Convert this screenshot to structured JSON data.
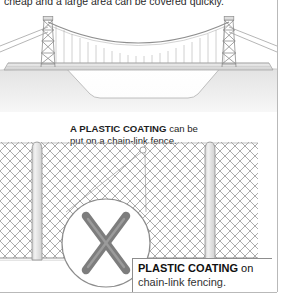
{
  "page": {
    "top_text": "cheap and a large area can be covered quickly.",
    "frame_color": "#b9b9b9"
  },
  "bridge": {
    "alt": "suspension-bridge-over-gorge",
    "tower_count": 2,
    "hanger_count": 22,
    "deck_color": "#e3e3e3",
    "ground_color": "#e6e6e6",
    "line_color": "#9a9a9a"
  },
  "fence": {
    "alt": "chain-link-fence-with-plastic-coating",
    "mesh_color": "#9e9e9e",
    "post_color": "#dcdcdc",
    "post_count": 2,
    "rail_color": "#8c8c8c"
  },
  "instruction": {
    "line1_kw": "A PLASTIC COATING",
    "line1_rest": " can be",
    "line2": "put on a chain-link fence."
  },
  "magnifier": {
    "alt": "magnified-coated-wire-crossing",
    "circle_color": "#8c8c8c",
    "wire_color": "#7d7d7d",
    "leader_marker": "callout-origin-circle"
  },
  "caption": {
    "line1_bold": "PLASTIC COATING",
    "line1_rest": " on",
    "line2": "chain-link fencing.",
    "border_color": "#8d8d8d"
  }
}
